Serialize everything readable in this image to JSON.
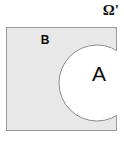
{
  "diagram": {
    "kind": "venn-diagram",
    "universe": {
      "label": "Ω'",
      "fill_color": "#e8e8e8",
      "border_color": "#9a9a9a",
      "x": 6,
      "y": 27,
      "width": 111,
      "height": 104
    },
    "sets": [
      {
        "id": "B",
        "label": "B",
        "shape": "rectangle-region",
        "fill_color": "#e8e8e8",
        "label_x": 45,
        "label_y": 44
      },
      {
        "id": "A",
        "label": "A",
        "shape": "circle",
        "fill_color": "#ffffff",
        "stroke_color": "#8c8c8c",
        "center_x": 97,
        "center_y": 83,
        "radius": 38,
        "label_x": 99,
        "label_y": 81
      }
    ],
    "background_color": "#ffffff",
    "caption": ""
  }
}
